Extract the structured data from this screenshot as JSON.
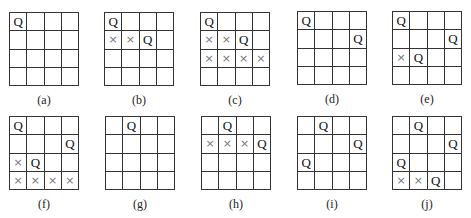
{
  "figure": {
    "boards": [
      {
        "id": "a",
        "label": "(a)",
        "left": 9,
        "top": 12,
        "cells": [
          [
            "Q",
            "",
            "",
            ""
          ],
          [
            "",
            "",
            "",
            ""
          ],
          [
            "",
            "",
            "",
            ""
          ],
          [
            "",
            "",
            "",
            ""
          ]
        ]
      },
      {
        "id": "b",
        "label": "(b)",
        "left": 104,
        "top": 12,
        "cells": [
          [
            "Q",
            "",
            "",
            ""
          ],
          [
            "×",
            "×",
            "Q",
            ""
          ],
          [
            "",
            "",
            "",
            ""
          ],
          [
            "",
            "",
            "",
            ""
          ]
        ]
      },
      {
        "id": "c",
        "label": "(c)",
        "left": 200,
        "top": 12,
        "cells": [
          [
            "Q",
            "",
            "",
            ""
          ],
          [
            "×",
            "×",
            "Q",
            ""
          ],
          [
            "×",
            "×",
            "×",
            "×"
          ],
          [
            "",
            "",
            "",
            ""
          ]
        ]
      },
      {
        "id": "d",
        "label": "(d)",
        "left": 297,
        "top": 11,
        "cells": [
          [
            "Q",
            "",
            "",
            ""
          ],
          [
            "",
            "",
            "",
            "Q"
          ],
          [
            "",
            "",
            "",
            ""
          ],
          [
            "",
            "",
            "",
            ""
          ]
        ]
      },
      {
        "id": "e",
        "label": "(e)",
        "left": 392,
        "top": 11,
        "cells": [
          [
            "Q",
            "",
            "",
            ""
          ],
          [
            "",
            "",
            "",
            "Q"
          ],
          [
            "×",
            "Q",
            "",
            ""
          ],
          [
            "",
            "",
            "",
            ""
          ]
        ]
      },
      {
        "id": "f",
        "label": "(f)",
        "left": 9,
        "top": 116,
        "cells": [
          [
            "Q",
            "",
            "",
            ""
          ],
          [
            "",
            "",
            "",
            "Q"
          ],
          [
            "×",
            "Q",
            "",
            ""
          ],
          [
            "×",
            "×",
            "×",
            "×"
          ]
        ]
      },
      {
        "id": "g",
        "label": "(g)",
        "left": 105,
        "top": 116,
        "cells": [
          [
            "",
            "Q",
            "",
            ""
          ],
          [
            "",
            "",
            "",
            ""
          ],
          [
            "",
            "",
            "",
            ""
          ],
          [
            "",
            "",
            "",
            ""
          ]
        ]
      },
      {
        "id": "h",
        "label": "(h)",
        "left": 201,
        "top": 116,
        "cells": [
          [
            "",
            "Q",
            "",
            ""
          ],
          [
            "×",
            "×",
            "×",
            "Q"
          ],
          [
            "",
            "",
            "",
            ""
          ],
          [
            "",
            "",
            "",
            ""
          ]
        ]
      },
      {
        "id": "i",
        "label": "(i)",
        "left": 297,
        "top": 116,
        "cells": [
          [
            "",
            "Q",
            "",
            ""
          ],
          [
            "",
            "",
            "",
            "Q"
          ],
          [
            "Q",
            "",
            "",
            ""
          ],
          [
            "",
            "",
            "",
            ""
          ]
        ]
      },
      {
        "id": "j",
        "label": "(j)",
        "left": 392,
        "top": 116,
        "cells": [
          [
            "",
            "Q",
            "",
            ""
          ],
          [
            "",
            "",
            "",
            "Q"
          ],
          [
            "Q",
            "",
            "",
            ""
          ],
          [
            "×",
            "×",
            "Q",
            ""
          ]
        ]
      }
    ],
    "symbols": {
      "queen": "Q",
      "blocked": "×"
    },
    "colors": {
      "line": "#333333",
      "queen": "#111111",
      "blocked": "#777777"
    }
  }
}
